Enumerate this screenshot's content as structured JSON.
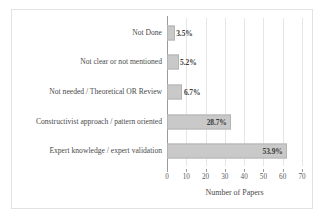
{
  "chart_data": {
    "type": "bar",
    "orientation": "horizontal",
    "title": "",
    "xlabel": "Number of Papers",
    "ylabel": "",
    "xlim": [
      0,
      70
    ],
    "xticks": [
      0,
      10,
      20,
      30,
      40,
      50,
      60,
      70
    ],
    "grid": true,
    "legend": null,
    "categories": [
      "Not Done",
      "Not clear or not mentioned",
      "Not needed / Theoretical OR Review",
      "Constructivist approach / pattern oriented",
      "Expert knowledge / expert validation"
    ],
    "values": [
      4,
      6,
      8,
      33,
      62
    ],
    "data_labels": [
      "3.5%",
      "5.2%",
      "6.7%",
      "28.7%",
      "53.9%"
    ],
    "bars": [
      {
        "category": "Not Done",
        "value": 4,
        "label": "3.5%",
        "label_inside": false
      },
      {
        "category": "Not clear or not mentioned",
        "value": 6,
        "label": "5.2%",
        "label_inside": false
      },
      {
        "category": "Not needed / Theoretical OR Review",
        "value": 8,
        "label": "6.7%",
        "label_inside": false
      },
      {
        "category": "Constructivist approach / pattern oriented",
        "value": 33,
        "label": "28.7%",
        "label_inside": true
      },
      {
        "category": "Expert knowledge / expert validation",
        "value": 62,
        "label": "53.9%",
        "label_inside": true
      }
    ],
    "colors": {
      "bar_fill": "#c9c9c9",
      "bar_border": "#b4b4b4",
      "gridline": "#e6e6e6",
      "axis": "#9a9a9a",
      "text": "#4a4a4a",
      "background": "#ffffff",
      "frame": "#e2e2e2"
    }
  }
}
